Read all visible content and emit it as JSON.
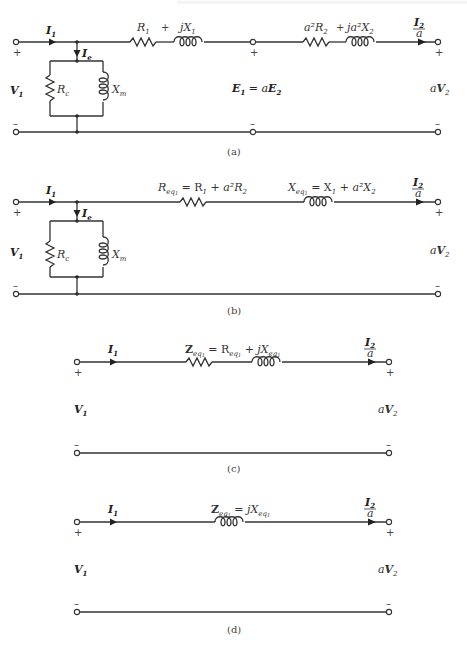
{
  "header_fragment": "(illegible running header text, cropped)",
  "diagrams": [
    {
      "id": "a",
      "caption": "(a)",
      "labels": {
        "input_current": "I",
        "input_current_sub": "1",
        "excitation_current": "I",
        "excitation_current_sub": "e",
        "core_resistance": "R",
        "core_resistance_sub": "c",
        "magnetizing_reactance": "X",
        "magnetizing_reactance_sub": "m",
        "input_voltage": "V",
        "input_voltage_sub": "1",
        "primary_resistance": "R",
        "primary_resistance_sub": "1",
        "plus_1": "+",
        "primary_reactance": "jX",
        "primary_reactance_sub": "1",
        "reflected_resistance": "a²R",
        "reflected_resistance_sub": "2",
        "plus_2": "+",
        "reflected_reactance": "ja²X",
        "reflected_reactance_sub": "2",
        "emf_relation_lhs": "E",
        "emf_relation_lhs_sub": "1",
        "emf_relation_eq": " = a",
        "emf_relation_rhs": "E",
        "emf_relation_rhs_sub": "2",
        "output_current_num": "I",
        "output_current_num_sub": "2",
        "output_current_den": "a",
        "output_voltage_coef": "a",
        "output_voltage": "V",
        "output_voltage_sub": "2",
        "plus": "+",
        "minus": "–"
      }
    },
    {
      "id": "b",
      "caption": "(b)",
      "labels": {
        "input_current": "I",
        "input_current_sub": "1",
        "excitation_current": "I",
        "excitation_current_sub": "e",
        "core_resistance": "R",
        "core_resistance_sub": "c",
        "magnetizing_reactance": "X",
        "magnetizing_reactance_sub": "m",
        "input_voltage": "V",
        "input_voltage_sub": "1",
        "eq_resistance": "R",
        "eq_resistance_sub": "eq",
        "eq_resistance_subsub": "1",
        "eq_resistance_expr": " = R",
        "eq_resistance_expr_sub": "1",
        "eq_resistance_expr2": " + a²R",
        "eq_resistance_expr2_sub": "2",
        "eq_reactance": "X",
        "eq_reactance_sub": "eq",
        "eq_reactance_subsub": "1",
        "eq_reactance_expr": " = X",
        "eq_reactance_expr_sub": "1",
        "eq_reactance_expr2": " + a²X",
        "eq_reactance_expr2_sub": "2",
        "output_current_num": "I",
        "output_current_num_sub": "2",
        "output_current_den": "a",
        "output_voltage_coef": "a",
        "output_voltage": "V",
        "output_voltage_sub": "2",
        "plus": "+",
        "minus": "–"
      }
    },
    {
      "id": "c",
      "caption": "(c)",
      "labels": {
        "input_current": "I",
        "input_current_sub": "1",
        "impedance": "Z",
        "impedance_sub": "eq",
        "impedance_subsub": "1",
        "impedance_expr": " = R",
        "impedance_expr_sub": "eq",
        "impedance_expr_subsub": "1",
        "impedance_expr2": " + jX",
        "impedance_expr2_sub": "eq",
        "impedance_expr2_subsub": "1",
        "input_voltage": "V",
        "input_voltage_sub": "1",
        "output_current_num": "I",
        "output_current_num_sub": "2",
        "output_current_den": "a",
        "output_voltage_coef": "a",
        "output_voltage": "V",
        "output_voltage_sub": "2",
        "plus": "+",
        "minus": "–"
      }
    },
    {
      "id": "d",
      "caption": "(d)",
      "labels": {
        "input_current": "I",
        "input_current_sub": "1",
        "impedance": "Z",
        "impedance_sub": "eq",
        "impedance_subsub": "1",
        "impedance_expr": " = jX",
        "impedance_expr_sub": "eq",
        "impedance_expr_subsub": "1",
        "input_voltage": "V",
        "input_voltage_sub": "1",
        "output_current_num": "I",
        "output_current_num_sub": "2",
        "output_current_den": "a",
        "output_voltage_coef": "a",
        "output_voltage": "V",
        "output_voltage_sub": "2",
        "plus": "+",
        "minus": "–"
      }
    }
  ]
}
